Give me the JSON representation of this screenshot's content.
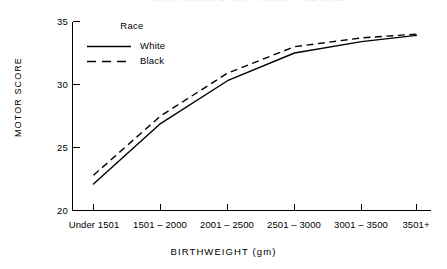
{
  "title_remnant": "MOTOR SCORE BY BIRTHWEIGHT AND RACE",
  "legend": {
    "title": "Race",
    "items": [
      {
        "label": "White",
        "style": "solid"
      },
      {
        "label": "Black",
        "style": "dashed"
      }
    ]
  },
  "axes": {
    "ylabel": "MOTOR SCORE",
    "xlabel": "BIRTHWEIGHT (gm)",
    "yticks": [
      "35",
      "30",
      "25",
      "20"
    ],
    "xticks": [
      "Under 1501",
      "1501 – 2000",
      "2001 – 2500",
      "2501 – 3000",
      "3001 – 3500",
      "3501+"
    ]
  },
  "chart_data": {
    "type": "line",
    "title": "",
    "xlabel": "BIRTHWEIGHT (gm)",
    "ylabel": "MOTOR SCORE",
    "categories": [
      "Under 1501",
      "1501 – 2000",
      "2001 – 2500",
      "2501 – 3000",
      "3001 – 3500",
      "3501+"
    ],
    "series": [
      {
        "name": "White",
        "style": "solid",
        "color": "#000000",
        "values": [
          22.1,
          26.9,
          30.3,
          32.5,
          33.4,
          33.9
        ]
      },
      {
        "name": "Black",
        "style": "dashed",
        "color": "#000000",
        "values": [
          22.8,
          27.5,
          30.9,
          33.0,
          33.7,
          34.0
        ]
      }
    ],
    "ylim": [
      20,
      35
    ],
    "ytick_values": [
      20,
      25,
      30,
      35
    ],
    "grid": false,
    "legend_position": "upper-left-inside",
    "legend_title": "Race"
  }
}
